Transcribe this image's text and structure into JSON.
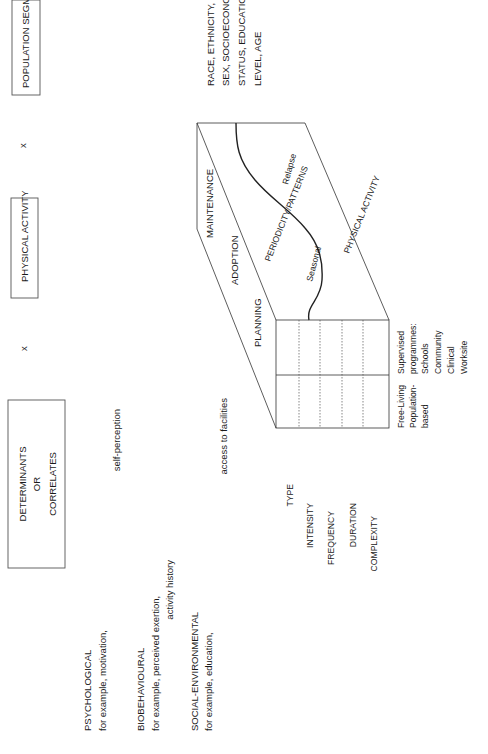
{
  "header_boxes": {
    "determinants": [
      "DETERMINANTS",
      "OR",
      "CORRELATES"
    ],
    "physical_activity": "PHYSICAL ACTIVITY",
    "population_segments": "POPULATION SEGMENTS"
  },
  "operators": {
    "left": "x",
    "right": "x"
  },
  "determinants_list": [
    {
      "title": "PSYCHOLOGICAL",
      "lines": [
        "for example, motivation,",
        "self-perception"
      ]
    },
    {
      "title": "BIOBEHAVIOURAL",
      "lines": [
        "for example, perceived exertion,",
        "activity history"
      ]
    },
    {
      "title": "SOCIAL-ENVIRONMENTAL",
      "lines": [
        "for example, education,",
        "access to facilities"
      ]
    }
  ],
  "population_detail": [
    "RACE, ETHNICITY,",
    "SEX, SOCIOECONOMIC",
    "STATUS, EDUCATIONAL",
    "LEVEL, AGE"
  ],
  "cube": {
    "stages": [
      "PLANNING",
      "ADOPTION",
      "MAINTENANCE"
    ],
    "periodicity": "PERIODICITY/PATTERNS",
    "physical_activity": "PHYSICAL ACTIVITY",
    "curve_labels": {
      "seasonal": "Seasonal",
      "relapse": "Relapse"
    },
    "dimensions": [
      "TYPE",
      "INTENSITY",
      "FREQUENCY",
      "DURATION",
      "COMPLEXITY"
    ],
    "settings": {
      "free_living": [
        "Free-Living",
        "Population-",
        "based"
      ],
      "supervised": [
        "Supervised",
        "programmes:",
        "Schools",
        "Community",
        "Clinical",
        "Worksite"
      ]
    }
  }
}
